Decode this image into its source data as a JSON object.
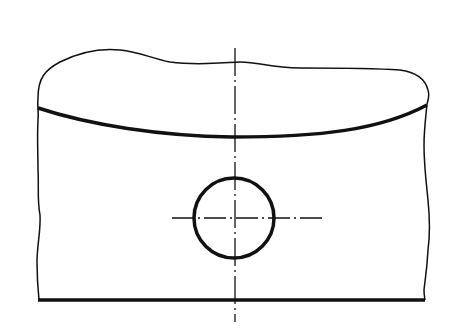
{
  "drawing": {
    "type": "technical-drawing",
    "description": "Broken-out section view of a part with a curved edge and a circular hole marked with centerlines",
    "colors": {
      "line": "#111111",
      "background": "#ffffff"
    },
    "elements": {
      "break_line_top": "freehand break line",
      "curved_edge": "thick visible edge (arc)",
      "bottom_edge": "thick visible edge",
      "hole": "circle, thick outline",
      "vertical_centerline": "dash-dot centerline",
      "horizontal_centerline": "dash-dot centerline"
    }
  }
}
